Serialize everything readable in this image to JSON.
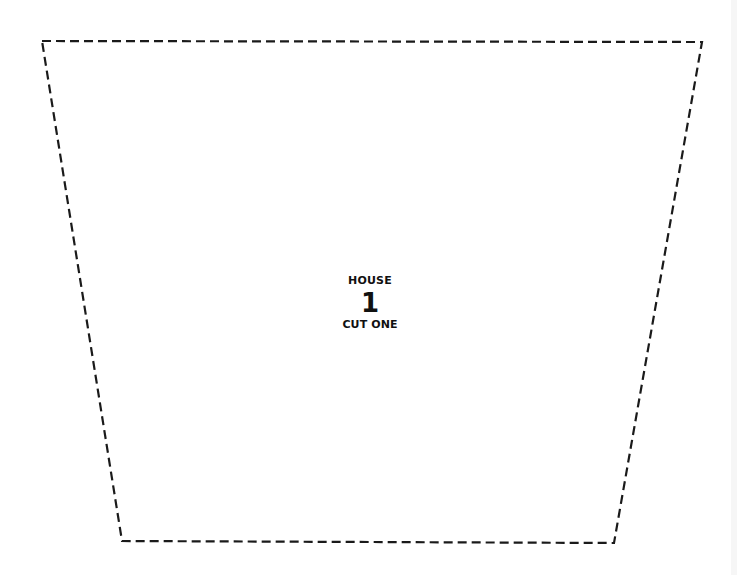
{
  "template": {
    "shape": "trapezoid",
    "outline_style": "dashed",
    "outline_color": "#1a1a1a",
    "corners": {
      "top_left": [
        42,
        41
      ],
      "top_right": [
        702,
        42
      ],
      "bottom_right": [
        614,
        543
      ],
      "bottom_left": [
        122,
        541
      ]
    }
  },
  "label": {
    "title": "HOUSE",
    "number": "1",
    "instruction": "CUT ONE"
  }
}
